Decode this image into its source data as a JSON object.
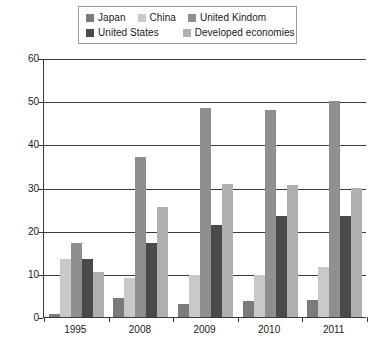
{
  "chart_data": {
    "type": "bar",
    "title": "",
    "subtitle": "",
    "xlabel": "",
    "ylabel": "",
    "categories": [
      "1995",
      "2008",
      "2009",
      "2010",
      "2011"
    ],
    "ylim": [
      0,
      60
    ],
    "ytick_values": [
      0,
      10,
      20,
      30,
      40,
      50,
      60
    ],
    "ytick_labels": [
      "0",
      "10",
      "20",
      "30",
      "40",
      "50",
      "60"
    ],
    "grid": true,
    "legend_position": "top",
    "series": [
      {
        "name": "Japan",
        "color": "#7b7b7b",
        "values": [
          0.7,
          4.3,
          3.0,
          3.8,
          4.0
        ]
      },
      {
        "name": "China",
        "color": "#c9c9c9",
        "values": [
          13.5,
          9.0,
          9.7,
          9.8,
          11.5
        ]
      },
      {
        "name": "United Kindom",
        "color": "#8f8f8f",
        "values": [
          17.2,
          37.0,
          48.5,
          48.0,
          50.0
        ]
      },
      {
        "name": "United States",
        "color": "#4a4a4a",
        "values": [
          13.5,
          17.2,
          21.3,
          23.3,
          23.3
        ]
      },
      {
        "name": "Developed economies",
        "color": "#b0b0b0",
        "values": [
          10.5,
          25.5,
          30.8,
          30.5,
          29.8
        ]
      }
    ]
  },
  "axes": {
    "y_ticks": [
      {
        "label": "60"
      },
      {
        "label": "50"
      },
      {
        "label": "40"
      },
      {
        "label": "30"
      },
      {
        "label": "20"
      },
      {
        "label": "10"
      },
      {
        "label": "0"
      }
    ],
    "x_ticks": [
      {
        "label": "1995"
      },
      {
        "label": "2008"
      },
      {
        "label": "2009"
      },
      {
        "label": "2010"
      },
      {
        "label": "2011"
      }
    ]
  },
  "legend": {
    "row1": [
      {
        "label": "Japan",
        "color": "#7b7b7b"
      },
      {
        "label": "China",
        "color": "#c9c9c9"
      },
      {
        "label": "United Kindom",
        "color": "#8f8f8f"
      }
    ],
    "row2": [
      {
        "label": "United States",
        "color": "#4a4a4a"
      },
      {
        "label": "Developed economies",
        "color": "#b0b0b0"
      }
    ]
  }
}
